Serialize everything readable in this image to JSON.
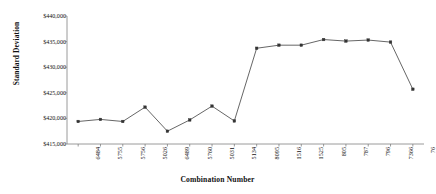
{
  "chart_data": {
    "type": "line",
    "title": "",
    "xlabel": "Combination Number",
    "ylabel": "Standard Deviation",
    "categories": [
      "6484",
      "5755",
      "5756",
      "5026",
      "6489",
      "5760",
      "5031",
      "5134",
      "8095",
      "1516",
      "1525",
      "805",
      "787",
      "796",
      "7366",
      "76"
    ],
    "values": [
      419400,
      419800,
      419400,
      422200,
      417500,
      419700,
      422400,
      419500,
      433700,
      434300,
      434300,
      435400,
      435100,
      435300,
      434900,
      425700
    ],
    "series": [
      {
        "name": "Standard Deviation",
        "values": [
          419400,
          419800,
          419400,
          422200,
          417500,
          419700,
          422400,
          419500,
          433700,
          434300,
          434300,
          435400,
          435100,
          435300,
          434900,
          425700
        ]
      }
    ],
    "ylim": [
      415000,
      440000
    ],
    "ytick_values": [
      415000,
      420000,
      425000,
      430000,
      435000,
      440000
    ],
    "ytick_labels": [
      "$415,000",
      "$420,000",
      "$425,000",
      "$430,000",
      "$435,000",
      "$440,000"
    ],
    "grid": false,
    "legend": null,
    "marker": "square",
    "line_color": "#555555",
    "marker_color": "#333333",
    "axis_color": "#808080",
    "background": "#ffffff"
  }
}
